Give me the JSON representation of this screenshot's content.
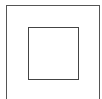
{
  "figure": {
    "outer_square": {
      "stroke": "#555555"
    },
    "inner_square": {
      "stroke": "#444444"
    },
    "background": "#ffffff"
  }
}
